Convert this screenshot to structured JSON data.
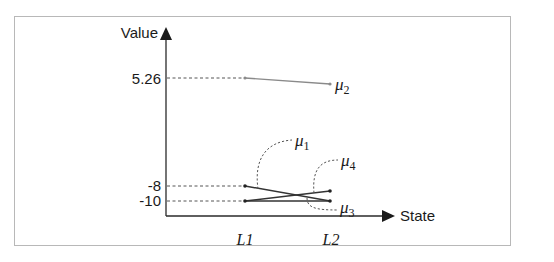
{
  "figure": {
    "y_axis_label": "Value",
    "x_axis_label": "State",
    "y_ticks": [
      {
        "label": "5.26",
        "value": 5.26
      },
      {
        "label": "-8",
        "value": -8
      },
      {
        "label": "-10",
        "value": -10
      }
    ],
    "x_ticks": [
      {
        "label": "L1"
      },
      {
        "label": "L2"
      }
    ],
    "series": [
      {
        "name": "μ2",
        "label_base": "μ",
        "label_sub": "2",
        "from": {
          "state": "L1",
          "value": 5.26
        },
        "to": {
          "state": "L2",
          "value": 4.9
        },
        "color": "#8a8a8a"
      },
      {
        "name": "μ1",
        "label_base": "μ",
        "label_sub": "1",
        "from": {
          "state": "L1",
          "value": -8
        },
        "to": {
          "state": "L2",
          "value": -10
        },
        "color": "#333333"
      },
      {
        "name": "μ4",
        "label_base": "μ",
        "label_sub": "4",
        "from": {
          "state": "L1",
          "value": -10
        },
        "to": {
          "state": "L2",
          "value": -9
        },
        "color": "#333333"
      },
      {
        "name": "μ3",
        "label_base": "μ",
        "label_sub": "3",
        "from": {
          "state": "L1",
          "value": -10
        },
        "to": {
          "state": "L2",
          "value": -10
        },
        "color": "#333333"
      }
    ]
  }
}
